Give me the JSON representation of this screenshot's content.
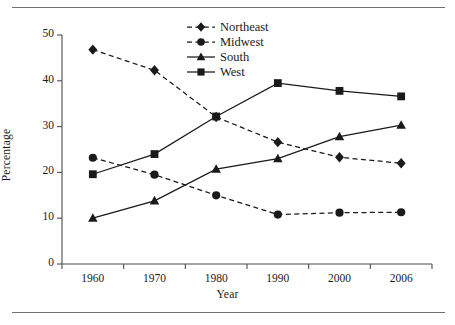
{
  "figure": {
    "ylabel": "Percentage",
    "xlabel": "Year"
  },
  "legend": {
    "items": [
      {
        "label": "Northeast",
        "marker": "diamond-marker",
        "line": "dashed",
        "color": "#1a1a1a"
      },
      {
        "label": "Midwest",
        "marker": "circle-marker",
        "line": "dashed",
        "color": "#1a1a1a"
      },
      {
        "label": "South",
        "marker": "triangle-marker",
        "line": "solid",
        "color": "#1a1a1a"
      },
      {
        "label": "West",
        "marker": "square-marker",
        "line": "solid",
        "color": "#1a1a1a"
      }
    ]
  },
  "axes": {
    "y_ticks": [
      "50",
      "40",
      "30",
      "20",
      "10",
      "0"
    ],
    "x_ticks": [
      "1960",
      "1970",
      "1980",
      "1990",
      "2000",
      "2006"
    ]
  },
  "chart_data": {
    "type": "line",
    "title": "",
    "xlabel": "Year",
    "ylabel": "Percentage",
    "categories": [
      "1960",
      "1970",
      "1980",
      "1990",
      "2000",
      "2006"
    ],
    "xlim": [
      1955,
      2011
    ],
    "ylim": [
      0,
      50
    ],
    "ytick_values": [
      0,
      10,
      20,
      30,
      40,
      50
    ],
    "grid": false,
    "legend_position": "top-center",
    "series": [
      {
        "name": "Northeast",
        "values": [
          46.8,
          42.3,
          32.1,
          26.6,
          23.3,
          22.0
        ],
        "line_style": "dashed",
        "marker": "diamond",
        "color": "#1a1a1a"
      },
      {
        "name": "Midwest",
        "values": [
          23.2,
          19.5,
          15.0,
          10.8,
          11.2,
          11.3
        ],
        "line_style": "dashed",
        "marker": "circle",
        "color": "#1a1a1a"
      },
      {
        "name": "South",
        "values": [
          10.0,
          13.8,
          20.7,
          23.0,
          27.8,
          30.3
        ],
        "line_style": "solid",
        "marker": "triangle",
        "color": "#1a1a1a"
      },
      {
        "name": "West",
        "values": [
          19.6,
          24.0,
          32.2,
          39.5,
          37.8,
          36.6
        ],
        "line_style": "solid",
        "marker": "square",
        "color": "#1a1a1a"
      }
    ]
  }
}
